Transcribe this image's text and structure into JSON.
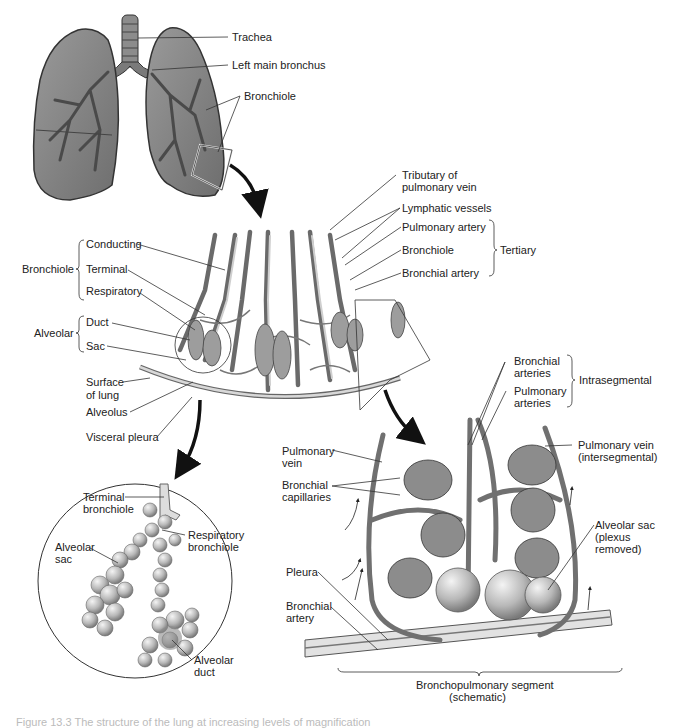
{
  "figure": {
    "caption": "Figure 13.3 The structure of the lung at increasing levels of magnification",
    "colors": {
      "lung_fill": "#8a8a8a",
      "lung_outline": "#3a3a3a",
      "vessel": "#777777",
      "vessel_light": "#c9c9c9",
      "alveolus": "#b5b5b5",
      "arrow": "#111111",
      "label_text": "#222222",
      "leader_line": "#333333"
    },
    "panel_lungs": {
      "labels": {
        "trachea": "Trachea",
        "left_main_bronchus": "Left main bronchus",
        "bronchiole": "Bronchiole"
      }
    },
    "panel_lobule": {
      "left_groups": {
        "bronchiole_group": "Bronchiole",
        "conducting": "Conducting",
        "terminal": "Terminal",
        "respiratory": "Respiratory",
        "alveolar_group": "Alveolar",
        "duct": "Duct",
        "sac": "Sac",
        "surface_of_lung_1": "Surface",
        "surface_of_lung_2": "of lung",
        "alveolus": "Alveolus",
        "visceral_pleura": "Visceral pleura"
      },
      "right_labels": {
        "tributary_1": "Tributary of",
        "tributary_2": "pulmonary vein",
        "lymphatic_vessels": "Lymphatic vessels",
        "pulmonary_artery": "Pulmonary artery",
        "bronchiole": "Bronchiole",
        "bronchial_artery": "Bronchial artery",
        "tertiary_group": "Tertiary"
      }
    },
    "panel_acinus": {
      "labels": {
        "terminal_bronchiole_1": "Terminal",
        "terminal_bronchiole_2": "bronchiole",
        "respiratory_bronchiole_1": "Respiratory",
        "respiratory_bronchiole_2": "bronchiole",
        "alveolar_sac_1": "Alveolar",
        "alveolar_sac_2": "sac",
        "alveolar_duct_1": "Alveolar",
        "alveolar_duct_2": "duct"
      }
    },
    "panel_segment": {
      "labels": {
        "bronchial_arteries_1": "Bronchial",
        "bronchial_arteries_2": "arteries",
        "pulmonary_arteries_1": "Pulmonary",
        "pulmonary_arteries_2": "arteries",
        "intrasegmental_group": "Intrasegmental",
        "pulmonary_vein_1": "Pulmonary",
        "pulmonary_vein_2": "vein",
        "pulmonary_vein_inter_1": "Pulmonary vein",
        "pulmonary_vein_inter_2": "(intersegmental)",
        "bronchial_capillaries_1": "Bronchial",
        "bronchial_capillaries_2": "capillaries",
        "alveolar_sac_1": "Alveolar sac",
        "alveolar_sac_2": "(plexus",
        "alveolar_sac_3": "removed)",
        "pleura": "Pleura",
        "bronchial_artery_1": "Bronchial",
        "bronchial_artery_2": "artery",
        "segment_1": "Bronchopulmonary segment",
        "segment_2": "(schematic)"
      }
    }
  }
}
